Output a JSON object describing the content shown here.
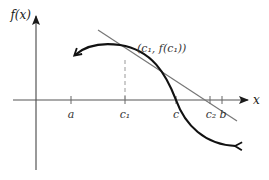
{
  "diagram": {
    "y_axis_label": "f(x)",
    "x_axis_label": "x",
    "point_label": "(c₁, f(c₁))",
    "ticks": [
      {
        "id": "a",
        "label": "a",
        "x": 71
      },
      {
        "id": "c1",
        "label": "c₁",
        "x": 125
      },
      {
        "id": "c",
        "label": "c",
        "x": 176
      },
      {
        "id": "c2",
        "label": "c₂",
        "x": 210
      },
      {
        "id": "b",
        "label": "b",
        "x": 222
      }
    ],
    "colors": {
      "curve": "#111111",
      "tangent": "#777777",
      "axis": "#444444",
      "dashed": "#999999",
      "text": "#333333"
    }
  }
}
